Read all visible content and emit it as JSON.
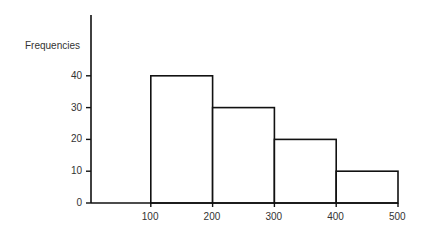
{
  "chart_data": {
    "type": "bar",
    "subtype": "histogram",
    "title": "",
    "xlabel": "",
    "ylabel": "Frequencies",
    "bins": [
      [
        100,
        200
      ],
      [
        200,
        300
      ],
      [
        300,
        400
      ],
      [
        400,
        500
      ]
    ],
    "categories": [
      "100-200",
      "200-300",
      "300-400",
      "400-500"
    ],
    "values": [
      40,
      30,
      20,
      10
    ],
    "x_ticks": [
      100,
      200,
      300,
      400,
      500
    ],
    "y_ticks": [
      0,
      10,
      20,
      30,
      40
    ],
    "xlim": [
      0,
      500
    ],
    "ylim": [
      0,
      58
    ],
    "grid": false,
    "legend": null,
    "bar_fill": "#ffffff",
    "bar_stroke": "#111111"
  },
  "labels": {
    "ylabel": "Frequencies",
    "y_ticks": [
      "0",
      "10",
      "20",
      "30",
      "40"
    ],
    "x_ticks": [
      "100",
      "200",
      "300",
      "400",
      "500"
    ]
  }
}
